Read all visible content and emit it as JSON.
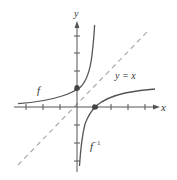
{
  "figure": {
    "type": "function-and-inverse-graph",
    "axes": {
      "x_label": "x",
      "y_label": "y",
      "tick_spacing_units": 1,
      "x_ticks": [
        -3,
        -2,
        -1,
        1,
        2,
        3,
        4
      ],
      "y_ticks": [
        -3,
        -2,
        -1,
        1,
        2,
        3
      ]
    },
    "curves": [
      {
        "name": "f",
        "label": "f",
        "formula": "f(x) = 1/(1 - x)",
        "color": "#555555",
        "marked_point": [
          0,
          1
        ]
      },
      {
        "name": "f_inverse",
        "label": "f",
        "label_sup": "−1",
        "formula": "f^-1(x) = 1 - 1/x",
        "color": "#555555",
        "marked_point": [
          1,
          0
        ]
      },
      {
        "name": "identity",
        "label": "y = x",
        "style": "dashed",
        "color": "#aaaaaa"
      }
    ],
    "colors": {
      "axis": "#555555",
      "curve": "#555555",
      "dashed": "#aaaaaa",
      "point": "#444444"
    }
  }
}
